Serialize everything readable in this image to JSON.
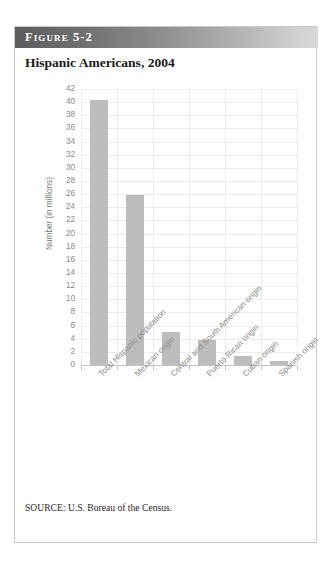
{
  "figure": {
    "banner_label": "Figure 5-2",
    "title": "Hispanic Americans, 2004",
    "source_note": "SOURCE: U.S. Bureau of the Census."
  },
  "colors": {
    "bar": "#bdbdbd",
    "grid": "#ebebeb",
    "axis": "#c4c4c4",
    "tick_text": "#8a8a8a",
    "banner_start": "#5c5c5c",
    "banner_end": "#d8d8d8",
    "card_border": "#c9c9c9"
  },
  "chart_data": {
    "type": "bar",
    "title": "Hispanic Americans, 2004",
    "xlabel": "",
    "ylabel": "Number (in millions)",
    "ylim": [
      0,
      42
    ],
    "ytick_step": 2,
    "yticks": [
      42,
      40,
      38,
      36,
      34,
      32,
      30,
      28,
      26,
      24,
      22,
      20,
      18,
      16,
      14,
      12,
      10,
      8,
      6,
      4,
      2,
      0
    ],
    "grid": true,
    "legend": "none",
    "categories": [
      "Total Hispanic population",
      "Mexican origin",
      "Central and South American origin",
      "Puerto Rican origin",
      "Cuban origin",
      "Spanish origin"
    ],
    "values": [
      40.4,
      25.9,
      5.1,
      3.8,
      1.4,
      0.6
    ],
    "units": "millions",
    "source": "U.S. Bureau of the Census."
  }
}
